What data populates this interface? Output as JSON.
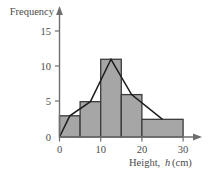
{
  "chart_data": {
    "type": "bar",
    "title": "",
    "subtitle": "",
    "xlabel": "Height, h (cm)",
    "xlabel_parts": {
      "prefix": "Height,",
      "variable": "h",
      "suffix": "(cm)"
    },
    "ylabel": "Frequency",
    "xlim": [
      0,
      33
    ],
    "ylim": [
      0,
      16.5
    ],
    "grid": false,
    "legend": null,
    "x_ticks": [
      0,
      10,
      20,
      30
    ],
    "x_tick_labels": [
      "0",
      "10",
      "20",
      "30"
    ],
    "y_ticks": [
      0,
      5,
      10,
      15
    ],
    "y_tick_labels": [
      "0",
      "5",
      "10",
      "15"
    ],
    "bin_edges": [
      0,
      5,
      10,
      15,
      20,
      30
    ],
    "categories": [
      "0-5",
      "5-10",
      "10-15",
      "15-20",
      "20-30"
    ],
    "values": [
      3,
      5,
      11,
      6,
      2.5
    ],
    "bars": [
      {
        "label": "0-5",
        "start": 0,
        "end": 5,
        "frequency": 3
      },
      {
        "label": "5-10",
        "start": 5,
        "end": 10,
        "frequency": 5
      },
      {
        "label": "10-15",
        "start": 10,
        "end": 15,
        "frequency": 11
      },
      {
        "label": "15-20",
        "start": 15,
        "end": 20,
        "frequency": 6
      },
      {
        "label": "20-30",
        "start": 20,
        "end": 30,
        "frequency": 2.5
      }
    ],
    "overlay": {
      "name": "frequency-polygon",
      "type": "line",
      "points": [
        {
          "x": 0,
          "y": 0
        },
        {
          "x": 2.5,
          "y": 3
        },
        {
          "x": 7.5,
          "y": 5
        },
        {
          "x": 12.5,
          "y": 11
        },
        {
          "x": 17.5,
          "y": 6
        },
        {
          "x": 25,
          "y": 2.5
        }
      ]
    },
    "colors": {
      "bar_fill": "#a6a6a6",
      "bar_stroke": "#3b3b3b",
      "polygon_stroke": "#1d1d1d",
      "axis": "#6e6e6e",
      "text": "#4a4a4a"
    }
  },
  "axes": {
    "y_label_text": "Frequency",
    "y_tick_15": "15",
    "y_tick_10": "10",
    "y_tick_5": "5",
    "y_tick_0": "0",
    "x_tick_0": "0",
    "x_tick_10": "10",
    "x_tick_20": "20",
    "x_tick_30": "30",
    "x_label_prefix": "Height,",
    "x_label_variable": "h",
    "x_label_suffix": "(cm)"
  }
}
